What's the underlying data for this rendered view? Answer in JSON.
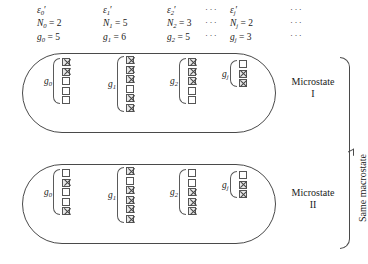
{
  "diagram": {
    "ellipsis": "···",
    "columns": [
      {
        "id": "level-0",
        "energy": "ε",
        "energy_sub": "0",
        "energy_prime": "′",
        "N_symbol": "N",
        "N_sub": "0",
        "N_value": "= 2",
        "g_symbol": "g",
        "g_sub": "0",
        "g_value": "= 5",
        "degeneracy": 5,
        "occupancy": 2,
        "trailing_dots": ""
      },
      {
        "id": "level-1",
        "energy": "ε",
        "energy_sub": "1",
        "energy_prime": "′",
        "N_symbol": "N",
        "N_sub": "1",
        "N_value": "= 5",
        "g_symbol": "g",
        "g_sub": "1",
        "g_value": "= 6",
        "degeneracy": 6,
        "occupancy": 5,
        "trailing_dots": ""
      },
      {
        "id": "level-2",
        "energy": "ε",
        "energy_sub": "2",
        "energy_prime": "′",
        "N_symbol": "N",
        "N_sub": "2",
        "N_value": "= 3",
        "g_symbol": "g",
        "g_sub": "2",
        "g_value": "= 5",
        "degeneracy": 5,
        "occupancy": 3,
        "trailing_dots": "···"
      },
      {
        "id": "level-j",
        "energy": "ε",
        "energy_sub": "j",
        "energy_prime": "′",
        "N_symbol": "N",
        "N_sub": "j",
        "N_value": "= 2",
        "g_symbol": "g",
        "g_sub": "j",
        "g_value": "= 3",
        "degeneracy": 3,
        "occupancy": 2,
        "trailing_dots": "···"
      }
    ],
    "microstates": [
      {
        "id": "microstate-1",
        "label_line1": "Microstate",
        "label_line2": "I",
        "groups": [
          {
            "label": "g",
            "sub": "0",
            "cells": [
              1,
              1,
              0,
              0,
              0
            ]
          },
          {
            "label": "g",
            "sub": "1",
            "cells": [
              1,
              1,
              1,
              0,
              1,
              1
            ]
          },
          {
            "label": "g",
            "sub": "2",
            "cells": [
              1,
              1,
              1,
              0,
              0
            ]
          },
          {
            "label": "g",
            "sub": "j",
            "cells": [
              0,
              1,
              1
            ]
          }
        ]
      },
      {
        "id": "microstate-2",
        "label_line1": "Microstate",
        "label_line2": "II",
        "groups": [
          {
            "label": "g",
            "sub": "0",
            "cells": [
              0,
              1,
              0,
              0,
              1
            ]
          },
          {
            "label": "g",
            "sub": "1",
            "cells": [
              1,
              0,
              1,
              1,
              1,
              1
            ]
          },
          {
            "label": "g",
            "sub": "2",
            "cells": [
              0,
              0,
              1,
              1,
              1
            ]
          },
          {
            "label": "g",
            "sub": "j",
            "cells": [
              0,
              1,
              1
            ]
          }
        ]
      }
    ],
    "macrostate_label": "Same macrostate"
  }
}
